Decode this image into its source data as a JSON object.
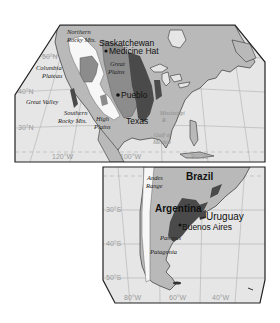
{
  "colors": {
    "ocean": "#e6e6e6",
    "land": "#b9b9b9",
    "mountain_white": "#f7f7f7",
    "medium_region": "#8c8c8c",
    "dark_region": "#4a4a4a",
    "frame": "#222222",
    "grid": "#a8a8a8"
  },
  "north_america": {
    "grid_labels": {
      "lat_50": "50°N",
      "lat_40": "40°N",
      "lat_30": "30°N",
      "lon_120": "120°W",
      "lon_100": "100°W",
      "lon_80": "80°W"
    },
    "region_labels": {
      "northern_rocky": [
        "Northern",
        "Rocky Mts."
      ],
      "columbia": [
        "Columbia",
        "Plateau"
      ],
      "great_plains": [
        "Great",
        "Plains"
      ],
      "great_valley": "Great Valley",
      "southern_rocky": [
        "Southern",
        "Rocky Mts."
      ],
      "high_plains": [
        "High",
        "Plains"
      ],
      "mississippi": [
        "Mississippi",
        "R."
      ],
      "gulf": [
        "Gulf of",
        "Mexico"
      ]
    },
    "place_labels": {
      "saskatchewan": "Saskatchewan",
      "medicine_hat": "Medicine Hat",
      "pueblo": "Pueblo",
      "texas": "Texas"
    }
  },
  "south_america": {
    "grid_labels": {
      "lat_30": "30°S",
      "lat_40": "40°S",
      "lat_50": "50°S",
      "lon_80": "80°W",
      "lon_60": "60°W",
      "lon_40": "40°W"
    },
    "region_labels": {
      "andes": [
        "Andes",
        "Range"
      ],
      "pampas": "Pampas",
      "patagonia": "Patagonia"
    },
    "place_labels": {
      "brazil": "Brazil",
      "argentina": "Argentina",
      "uruguay": "Uruguay",
      "buenos_aires": "Buenos Aires"
    }
  }
}
